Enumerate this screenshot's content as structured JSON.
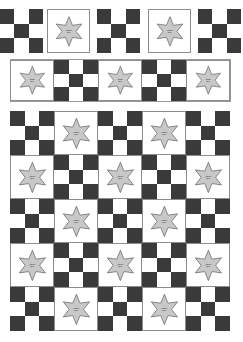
{
  "quilt": {
    "badge_text_line1": "SHERIFF",
    "badge_text_line2": "BILLY",
    "colors": {
      "dark_square": "#3a3a3a",
      "light_square": "#ffffff",
      "star_fill": "#c8c8c8",
      "star_stroke": "#555555",
      "border": "#8c8c8c"
    },
    "top_row": {
      "blocks": [
        "nine-patch",
        "star",
        "nine-patch",
        "star",
        "nine-patch"
      ]
    },
    "banner_row": {
      "blocks": [
        "star",
        "nine-patch",
        "star",
        "nine-patch",
        "star"
      ]
    },
    "main_grid": {
      "columns": 5,
      "rows": 5,
      "pattern": "alternating nine-patch and star, starting with nine-patch"
    }
  }
}
